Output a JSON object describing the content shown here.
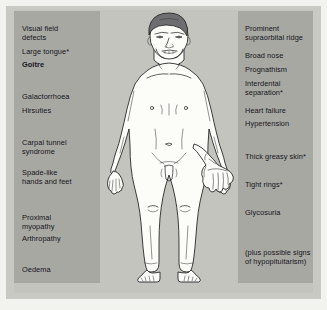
{
  "diagram": {
    "background_color": "#c4c4bf",
    "panel_color": "#a8a8a3",
    "text_color": "#15151a",
    "skin_color": "#fbfbf7",
    "hair_color": "#6e6e70",
    "outline_color": "#1d1d20"
  },
  "left_panel": {
    "name": "left-findings-panel",
    "items": [
      {
        "label": "Visual field\ndefects",
        "bold": false,
        "top": 14
      },
      {
        "label": "Large tongue*",
        "bold": false,
        "top": 37
      },
      {
        "label": "Goitre",
        "bold": true,
        "top": 50
      },
      {
        "label": "Galactorrhoea",
        "bold": false,
        "top": 82
      },
      {
        "label": "Hirsuties",
        "bold": false,
        "top": 96
      },
      {
        "label": "Carpal tunnel\nsyndrome",
        "bold": false,
        "top": 128
      },
      {
        "label": "Spade-like\nhands and feet",
        "bold": false,
        "top": 158
      },
      {
        "label": "Proximal\nmyopathy",
        "bold": false,
        "top": 203
      },
      {
        "label": "Arthropathy",
        "bold": false,
        "top": 224
      },
      {
        "label": "Oedema",
        "bold": false,
        "top": 255
      }
    ]
  },
  "right_panel": {
    "name": "right-findings-panel",
    "items": [
      {
        "label": "Prominent\nsupraorbital ridge",
        "bold": false,
        "top": 14
      },
      {
        "label": "Broad nose",
        "bold": false,
        "top": 41
      },
      {
        "label": "Prognathism",
        "bold": false,
        "top": 55
      },
      {
        "label": "Interdental\nseparation*",
        "bold": false,
        "top": 69
      },
      {
        "label": "Heart failure",
        "bold": false,
        "top": 96
      },
      {
        "label": "Hypertension",
        "bold": false,
        "top": 109
      },
      {
        "label": "Thick greasy skin*",
        "bold": false,
        "top": 142
      },
      {
        "label": "Tight rings*",
        "bold": false,
        "top": 170
      },
      {
        "label": "Glycosuria",
        "bold": false,
        "top": 198
      },
      {
        "label": "(plus possible signs\nof hypopituitarism)",
        "bold": false,
        "top": 238
      }
    ]
  },
  "illustration": {
    "body_figure_name": "acromegaly-body-figure",
    "hand_detail_name": "spade-like-hand-detail"
  }
}
